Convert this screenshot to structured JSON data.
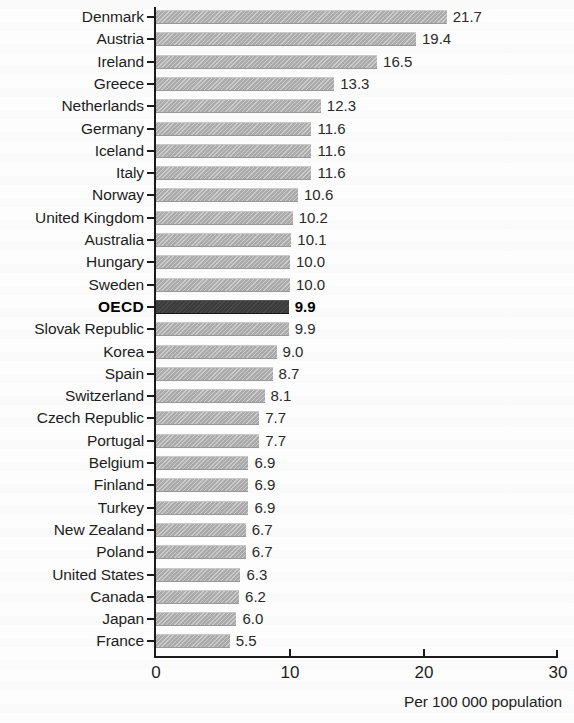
{
  "chart_data": {
    "type": "bar",
    "orientation": "horizontal",
    "title": "",
    "subtitle": "",
    "xlabel": "Per 100 000 population",
    "ylabel": "",
    "xlim": [
      0,
      30
    ],
    "xticks": [
      "0",
      "10",
      "20",
      "30"
    ],
    "grid": false,
    "legend": null,
    "highlight_category": "OECD",
    "categories": [
      "Denmark",
      "Austria",
      "Ireland",
      "Greece",
      "Netherlands",
      "Germany",
      "Iceland",
      "Italy",
      "Norway",
      "United Kingdom",
      "Australia",
      "Hungary",
      "Sweden",
      "OECD",
      "Slovak Republic",
      "Korea",
      "Spain",
      "Switzerland",
      "Czech Republic",
      "Portugal",
      "Belgium",
      "Finland",
      "Turkey",
      "New Zealand",
      "Poland",
      "United States",
      "Canada",
      "Japan",
      "France"
    ],
    "values": [
      21.7,
      19.4,
      16.5,
      13.3,
      12.3,
      11.6,
      11.6,
      11.6,
      10.6,
      10.2,
      10.1,
      10.0,
      10.0,
      9.9,
      9.9,
      9.0,
      8.7,
      8.1,
      7.7,
      7.7,
      6.9,
      6.9,
      6.9,
      6.7,
      6.7,
      6.3,
      6.2,
      6.0,
      5.5
    ],
    "value_labels": [
      "21.7",
      "19.4",
      "16.5",
      "13.3",
      "12.3",
      "11.6",
      "11.6",
      "11.6",
      "10.6",
      "10.2",
      "10.1",
      "10.0",
      "10.0",
      "9.9",
      "9.9",
      "9.0",
      "8.7",
      "8.1",
      "7.7",
      "7.7",
      "6.9",
      "6.9",
      "6.9",
      "6.7",
      "6.7",
      "6.3",
      "6.2",
      "6.0",
      "5.5"
    ]
  },
  "colors": {
    "bar": "#ababab",
    "bar_highlight": "#3c3c3c",
    "axis": "#1b1b1b",
    "text": "#1d1d1d",
    "background": "#fdfdfd"
  }
}
